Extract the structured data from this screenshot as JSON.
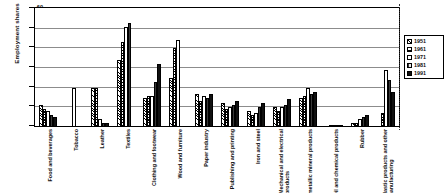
{
  "chart_data": {
    "type": "bar",
    "title": "",
    "xlabel": "",
    "ylabel": "Employment shares",
    "ylim": [
      0,
      60
    ],
    "yticks": [
      0,
      10,
      20,
      30,
      40,
      50,
      60
    ],
    "grid": true,
    "legend_position": "right",
    "categories": [
      "Food and beverages",
      "Tobacco",
      "Leather",
      "Textiles",
      "Clothing and footwear",
      "Wood and furniture",
      "Paper industry",
      "Publishing and printing",
      "Iron and steel",
      "Mechanical and electrical products",
      "Non-metallic mineral products",
      "Oil and chemical products",
      "Rubber",
      "Plastic products and other manufacturing"
    ],
    "series": [
      {
        "name": "1951",
        "values": [
          11,
          0,
          20,
          34,
          15,
          25,
          17,
          12,
          8,
          10,
          15,
          0,
          2,
          0
        ]
      },
      {
        "name": "1961",
        "values": [
          9,
          0,
          20,
          43,
          16,
          40,
          13,
          9,
          6,
          8,
          16,
          1,
          2,
          7
        ]
      },
      {
        "name": "1971",
        "values": [
          8,
          20,
          4,
          51,
          16,
          44,
          16,
          10,
          7,
          10,
          20,
          1,
          4,
          29
        ]
      },
      {
        "name": "1981",
        "values": [
          6,
          0,
          2,
          53,
          23,
          0,
          15,
          11,
          10,
          11,
          17,
          1,
          5,
          24
        ]
      },
      {
        "name": "1991",
        "values": [
          5,
          0,
          2,
          0,
          32,
          0,
          17,
          13,
          12,
          14,
          18,
          1,
          6,
          18
        ]
      }
    ],
    "legend": [
      "1951",
      "1961",
      "1971",
      "1981",
      "1991"
    ],
    "series_colors": [
      "#000000",
      "#000000",
      "#ffffff",
      "#3a3a3a",
      "#111111"
    ]
  },
  "axis": {
    "y_title": "Employment shares"
  },
  "category_lines": [
    [
      "Food and beverages",
      ""
    ],
    [
      "Tobacco",
      ""
    ],
    [
      "Leather",
      ""
    ],
    [
      "Textiles",
      ""
    ],
    [
      "Clothing and footwear",
      ""
    ],
    [
      "Wood and furniture",
      ""
    ],
    [
      "Paper industry",
      ""
    ],
    [
      "Publishing and printing",
      ""
    ],
    [
      "Iron and steel",
      ""
    ],
    [
      "Mechanical and electrical",
      "products"
    ],
    [
      "Non-metallic mineral products",
      ""
    ],
    [
      "Oil and chemical products",
      ""
    ],
    [
      "Rubber",
      ""
    ],
    [
      "Plastic products and other",
      "manufacturing"
    ]
  ]
}
